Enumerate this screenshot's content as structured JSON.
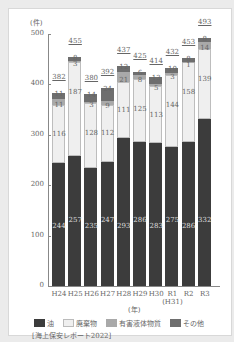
{
  "chart_data": {
    "type": "bar",
    "stacked": true,
    "title": "",
    "xlabel": "(年)",
    "ylabel": "(件)",
    "ylim": [
      0,
      500
    ],
    "yticks": [
      0,
      100,
      200,
      300,
      400,
      500
    ],
    "categories": [
      "H24",
      "H25",
      "H26",
      "H27",
      "H28",
      "H29",
      "H30",
      "R1",
      "R2",
      "R3"
    ],
    "category_sublabels": [
      "",
      "",
      "",
      "",
      "",
      "",
      "",
      "(H31)",
      "",
      ""
    ],
    "series": [
      {
        "name": "油",
        "color": "#3c3c3c",
        "values": [
          244,
          257,
          235,
          247,
          293,
          286,
          283,
          275,
          286,
          332
        ]
      },
      {
        "name": "廃棄物",
        "color": "#efefef",
        "values": [
          116,
          187,
          128,
          112,
          111,
          125,
          113,
          144,
          158,
          139
        ]
      },
      {
        "name": "有害液体物質",
        "color": "#a9a9a9",
        "values": [
          11,
          3,
          3,
          9,
          21,
          8,
          5,
          3,
          1,
          14
        ]
      },
      {
        "name": "その他",
        "color": "#6e6e6e",
        "values": [
          11,
          8,
          14,
          24,
          12,
          6,
          13,
          10,
          8,
          8
        ]
      }
    ],
    "totals": [
      382,
      455,
      380,
      392,
      437,
      425,
      414,
      432,
      453,
      493
    ],
    "legend_position": "bottom",
    "grid": false,
    "source": "[海上保安レポート2022]"
  },
  "labels": {
    "unit": "(件)",
    "x_unit": "(年)",
    "source": "[海上保安レポート2022]",
    "legend": [
      "油",
      "廃棄物",
      "有害液体物質",
      "その他"
    ]
  }
}
